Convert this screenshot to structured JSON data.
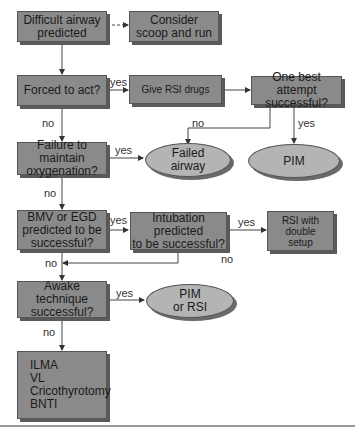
{
  "nodes": {
    "difficult_airway": "Difficult airway\npredicted",
    "consider_scoop": "Consider\nscoop and run",
    "forced_to_act": "Forced to act?",
    "give_rsi_drugs": "Give RSI drugs",
    "one_best_attempt": "One best attempt\nsuccessful?",
    "failure_oxygenation": "Failure to maintain\noxygenation?",
    "failed_airway": "Failed\nairway",
    "pim": "PIM",
    "bmv_egd": "BMV or EGD\npredicted to be\nsuccessful?",
    "intubation_predicted": "Intubation predicted\nto be successful?",
    "rsi_double_setup": "RSI  with\ndouble\nsetup",
    "awake_technique": "Awake technique\nsuccessful?",
    "pim_or_rsi": "PIM\nor RSI",
    "alternatives": "ILMA\nVL\nCricothyrotomy\nBNTI"
  },
  "edge_labels": {
    "forced_yes": "yes",
    "forced_no": "no",
    "attempt_no": "no",
    "attempt_yes": "yes",
    "oxygenation_yes": "yes",
    "oxygenation_no": "no",
    "bmv_yes": "yes",
    "intubation_yes": "yes",
    "intubation_no": "no",
    "bmv_no": "no",
    "awake_yes": "yes",
    "awake_no": "no"
  },
  "colors": {
    "box_fill": "#8a8a8a",
    "ellipse_fill": "#b4b4b4",
    "line": "#444444"
  }
}
